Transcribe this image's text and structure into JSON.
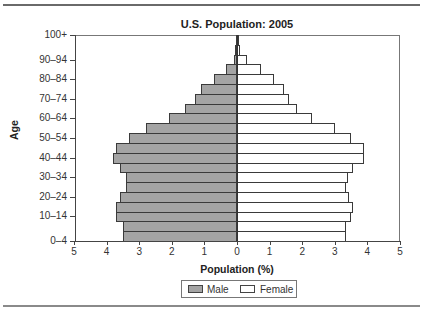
{
  "chart_data": {
    "type": "bar",
    "orientation": "horizontal",
    "subtype": "population-pyramid",
    "title": "U.S. Population: 2005",
    "xlabel": "Population (%)",
    "ylabel": "Age",
    "xlim": [
      -5,
      5
    ],
    "x_ticks": [
      "5",
      "4",
      "3",
      "2",
      "1",
      "0",
      "1",
      "2",
      "3",
      "4",
      "5"
    ],
    "y_tick_labels": [
      "0–4",
      "10–14",
      "20–24",
      "30–34",
      "40–44",
      "50–54",
      "60–64",
      "70–74",
      "80–84",
      "90–94",
      "100+"
    ],
    "categories": [
      "0–4",
      "5–9",
      "10–14",
      "15–19",
      "20–24",
      "25–29",
      "30–34",
      "35–39",
      "40–44",
      "45–49",
      "50–54",
      "55–59",
      "60–64",
      "65–69",
      "70–74",
      "75–79",
      "80–84",
      "85–89",
      "90–94",
      "95–99",
      "100+"
    ],
    "series": [
      {
        "name": "Male",
        "color": "#a4a4a4",
        "values": [
          3.5,
          3.5,
          3.7,
          3.7,
          3.6,
          3.4,
          3.4,
          3.6,
          3.8,
          3.7,
          3.3,
          2.8,
          2.1,
          1.6,
          1.3,
          1.1,
          0.7,
          0.35,
          0.1,
          0.05,
          0.01
        ]
      },
      {
        "name": "Female",
        "color": "#ffffff",
        "values": [
          3.35,
          3.35,
          3.5,
          3.55,
          3.45,
          3.35,
          3.4,
          3.55,
          3.9,
          3.9,
          3.5,
          3.0,
          2.3,
          1.85,
          1.6,
          1.45,
          1.15,
          0.75,
          0.3,
          0.1,
          0.02
        ]
      }
    ],
    "legend": [
      "Male",
      "Female"
    ],
    "legend_position": "bottom",
    "grid": false
  },
  "legend": {
    "male": "Male",
    "female": "Female"
  }
}
